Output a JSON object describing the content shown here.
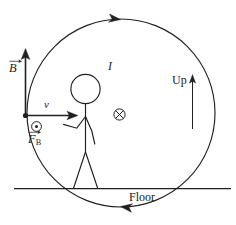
{
  "figure": {
    "background_color": "#ffffff",
    "stroke_color": "#231f20",
    "labels": {
      "magnetic_field": "B",
      "velocity": "v",
      "magnetic_force_symbol": "F",
      "magnetic_force_subscript": "B",
      "current": "I",
      "up_direction": "Up",
      "floor": "Floor"
    },
    "symbols": {
      "out_of_page": "dot-in-circle",
      "into_page": "cross-in-circle"
    },
    "geometry": {
      "loop_center_x": 121,
      "loop_center_y": 113,
      "loop_radius": 94,
      "floor_y": 188,
      "floor_x_start": 14,
      "floor_x_end": 231
    },
    "arrows": {
      "loop_top_direction": "clockwise-right",
      "loop_bottom_direction": "clockwise-left",
      "b_field_direction": "up",
      "velocity_direction": "right",
      "up_arrow_direction": "up"
    }
  }
}
